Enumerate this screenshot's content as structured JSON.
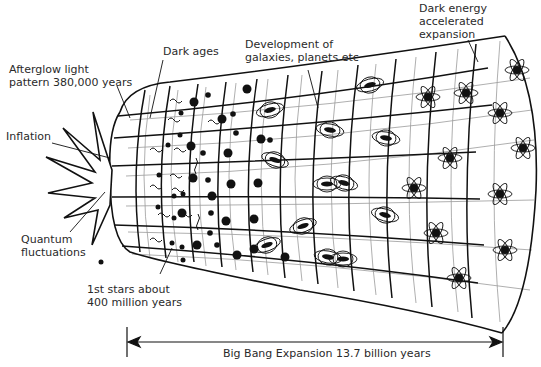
{
  "diagram": {
    "title": "Big Bang Expansion",
    "labels": {
      "afterglow": "Afterglow light\npattern 380,000 years",
      "dark_ages": "Dark ages",
      "development": "Development of\ngalaxies, planets etc",
      "dark_energy": "Dark energy\naccelerated\nexpansion",
      "inflation": "Inflation",
      "quantum": "Quantum\nfluctuations",
      "first_stars": "1st stars about\n400 million years",
      "timeline": "Big Bang Expansion 13.7 billion years"
    },
    "colors": {
      "ink": "#111111",
      "grid_light": "#9a9a9a",
      "text": "#2a2a2a",
      "background": "#ffffff"
    },
    "stages": [
      "Inflation",
      "Quantum fluctuations",
      "Afterglow light pattern 380,000 years",
      "Dark ages",
      "1st stars about 400 million years",
      "Development of galaxies, planets etc",
      "Dark energy accelerated expansion"
    ]
  }
}
